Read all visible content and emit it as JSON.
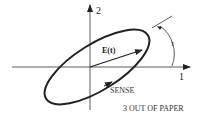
{
  "diagram": {
    "axis_1_label": "1",
    "axis_2_label": "2",
    "axis_3_note": "3 OUT OF PAPER",
    "vector_label": "E(t)",
    "sense_label": "SENSE",
    "angle_label": "τ",
    "colors": {
      "stroke": "#222222",
      "background": "#ffffff"
    }
  }
}
